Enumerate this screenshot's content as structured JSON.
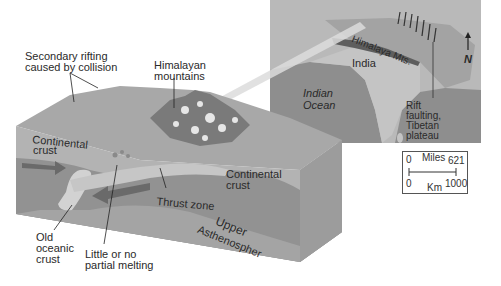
{
  "figure": {
    "type": "block-diagram-with-inset-map",
    "colors": {
      "background": "#ffffff",
      "surface": "#a9a9a9",
      "continental_crust": "#b5b5b5",
      "lower_lithosphere": "#8f8f8f",
      "asthenosphere": "#a6a6a6",
      "oceanic_plate": "#cfcfcf",
      "arrow": "#6b6b6b",
      "ocean": "#8d8d8d",
      "land": "#bdbdbd"
    }
  },
  "block_labels": {
    "secondary_rifting_line1": "Secondary rifting",
    "secondary_rifting_line2": "caused by collision",
    "himalayan_line1": "Himalayan",
    "himalayan_line2": "mountains",
    "continental_left_line1": "Continental",
    "continental_left_line2": "crust",
    "continental_right_line1": "Continental",
    "continental_right_line2": "crust",
    "thrust_zone": "Thrust zone",
    "upper": "Upper",
    "asthenosphere": "Asthenospher",
    "old_oceanic_line1": "Old",
    "old_oceanic_line2": "oceanic",
    "old_oceanic_line3": "crust",
    "little_melting_line1": "Little or no",
    "little_melting_line2": "partial melting"
  },
  "map": {
    "himalaya": "Himalaya Mts.",
    "india": "India",
    "indian_ocean_line1": "Indian",
    "indian_ocean_line2": "Ocean",
    "rift_line1": "Rift",
    "rift_line2": "faulting,",
    "rift_line3": "Tibetan",
    "rift_line4": "plateau",
    "north": "N"
  },
  "scale_bar": {
    "miles_label": "Miles",
    "miles_min": "0",
    "miles_max": "621",
    "km_label": "Km",
    "km_min": "0",
    "km_max": "1000"
  }
}
